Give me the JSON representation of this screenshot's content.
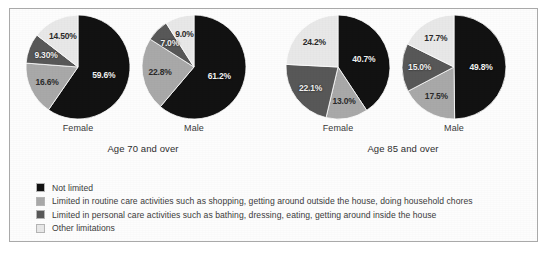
{
  "chart_data": [
    {
      "type": "pie",
      "title": "Age 70 and over",
      "subgroup": "Female",
      "categories": [
        "Not limited",
        "Limited in routine care activities such as shopping, getting around outside the house, doing household chores",
        "Limited in personal care activities such as bathing, dressing, eating, getting around inside the house",
        "Other limitations"
      ],
      "values": [
        59.6,
        16.6,
        9.3,
        14.5
      ],
      "labels": [
        "59.6%",
        "16.6%",
        "9.30%",
        "14.50%"
      ],
      "colors": [
        "#121212",
        "#a9a9a9",
        "#585858",
        "#e8e8e8"
      ],
      "xlabel": "",
      "ylabel": "",
      "grid": false,
      "legend_position": "bottom"
    },
    {
      "type": "pie",
      "title": "Age 70 and over",
      "subgroup": "Male",
      "categories": [
        "Not limited",
        "Limited in routine care activities such as shopping, getting around outside the house, doing household chores",
        "Limited in personal care activities such as bathing, dressing, eating, getting around inside the house",
        "Other limitations"
      ],
      "values": [
        61.2,
        22.8,
        7.0,
        9.0
      ],
      "labels": [
        "61.2%",
        "22.8%",
        "7.0%",
        "9.0%"
      ],
      "colors": [
        "#121212",
        "#a9a9a9",
        "#585858",
        "#e8e8e8"
      ],
      "xlabel": "",
      "ylabel": "",
      "grid": false,
      "legend_position": "bottom"
    },
    {
      "type": "pie",
      "title": "Age 85 and over",
      "subgroup": "Female",
      "categories": [
        "Not limited",
        "Limited in routine care activities such as shopping, getting around outside the house, doing household chores",
        "Limited in personal care activities such as bathing, dressing, eating, getting around inside the house",
        "Other limitations"
      ],
      "values": [
        40.7,
        13.0,
        22.1,
        24.2
      ],
      "labels": [
        "40.7%",
        "13.0%",
        "22.1%",
        "24.2%"
      ],
      "colors": [
        "#121212",
        "#a9a9a9",
        "#585858",
        "#e8e8e8"
      ],
      "xlabel": "",
      "ylabel": "",
      "grid": false,
      "legend_position": "bottom"
    },
    {
      "type": "pie",
      "title": "Age 85 and over",
      "subgroup": "Male",
      "categories": [
        "Not limited",
        "Limited in routine care activities such as shopping, getting around outside the house, doing household chores",
        "Limited in personal care activities such as bathing, dressing, eating, getting around inside the house",
        "Other limitations"
      ],
      "values": [
        49.8,
        17.5,
        15.0,
        17.7
      ],
      "labels": [
        "49.8%",
        "17.5%",
        "15.0%",
        "17.7%"
      ],
      "colors": [
        "#121212",
        "#a9a9a9",
        "#585858",
        "#e8e8e8"
      ],
      "xlabel": "",
      "ylabel": "",
      "grid": false,
      "legend_position": "bottom"
    }
  ],
  "groups": [
    {
      "label": "Age 70 and over",
      "pies": [
        {
          "sex": "Female",
          "slices": [
            {
              "label": "59.6%",
              "value": 59.6,
              "color": "#121212",
              "text_tone": "dark"
            },
            {
              "label": "16.6%",
              "value": 16.6,
              "color": "#a9a9a9",
              "text_tone": "light"
            },
            {
              "label": "9.30%",
              "value": 9.3,
              "color": "#585858",
              "text_tone": "dark"
            },
            {
              "label": "14.50%",
              "value": 14.5,
              "color": "#e8e8e8",
              "text_tone": "light"
            }
          ]
        },
        {
          "sex": "Male",
          "slices": [
            {
              "label": "61.2%",
              "value": 61.2,
              "color": "#121212",
              "text_tone": "dark"
            },
            {
              "label": "22.8%",
              "value": 22.8,
              "color": "#a9a9a9",
              "text_tone": "light"
            },
            {
              "label": "7.0%",
              "value": 7.0,
              "color": "#585858",
              "text_tone": "dark"
            },
            {
              "label": "9.0%",
              "value": 9.0,
              "color": "#e8e8e8",
              "text_tone": "light"
            }
          ]
        }
      ]
    },
    {
      "label": "Age 85 and over",
      "pies": [
        {
          "sex": "Female",
          "slices": [
            {
              "label": "40.7%",
              "value": 40.7,
              "color": "#121212",
              "text_tone": "dark"
            },
            {
              "label": "13.0%",
              "value": 13.0,
              "color": "#a9a9a9",
              "text_tone": "light"
            },
            {
              "label": "22.1%",
              "value": 22.1,
              "color": "#585858",
              "text_tone": "dark"
            },
            {
              "label": "24.2%",
              "value": 24.2,
              "color": "#e8e8e8",
              "text_tone": "light"
            }
          ]
        },
        {
          "sex": "Male",
          "slices": [
            {
              "label": "49.8%",
              "value": 49.8,
              "color": "#121212",
              "text_tone": "dark"
            },
            {
              "label": "17.5%",
              "value": 17.5,
              "color": "#a9a9a9",
              "text_tone": "light"
            },
            {
              "label": "15.0%",
              "value": 15.0,
              "color": "#585858",
              "text_tone": "dark"
            },
            {
              "label": "17.7%",
              "value": 17.7,
              "color": "#e8e8e8",
              "text_tone": "light"
            }
          ]
        }
      ]
    }
  ],
  "legend": {
    "items": [
      {
        "color": "#121212",
        "label": "Not limited"
      },
      {
        "color": "#a9a9a9",
        "label": "Limited in routine care activities such as shopping, getting around outside the house, doing household chores"
      },
      {
        "color": "#585858",
        "label": "Limited in personal care activities such as bathing, dressing, eating, getting around inside the house"
      },
      {
        "color": "#e8e8e8",
        "label": "Other limitations"
      }
    ]
  }
}
